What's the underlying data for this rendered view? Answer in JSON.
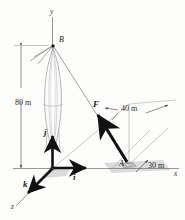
{
  "figure": {
    "type": "engineering-mechanics-vector-diagram",
    "background_color": "#fdfdfc",
    "line_color": "#555555",
    "bold_color": "#111111",
    "shadow_color": "#c9c9c9"
  },
  "axes": {
    "y_label": "y",
    "x_label": "x",
    "z_label": "z"
  },
  "points": {
    "B": "B",
    "A": "A"
  },
  "vectors": {
    "force": "F",
    "unit_direction": "λ",
    "i": "i",
    "j": "j",
    "k": "k"
  },
  "dimensions": {
    "height": "80 m",
    "depth": "40 m",
    "offset": "30 m"
  }
}
